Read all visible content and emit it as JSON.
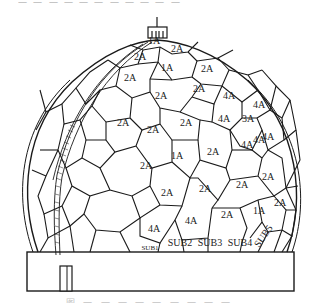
{
  "figure": {
    "caption_top_fragment": "一 一 一 一 一 一 一 一 一 一 一",
    "caption_bottom_fragment": "图 一 一 一 一 一 一 一 一 一",
    "colors": {
      "line": "#1a1a1a",
      "background": "#ffffff",
      "label": "#222222"
    }
  },
  "dome": {
    "panel_labels": [
      {
        "text": "1A",
        "x": 154,
        "y": 44
      },
      {
        "text": "2A",
        "x": 177,
        "y": 52
      },
      {
        "text": "2A",
        "x": 140,
        "y": 60
      },
      {
        "text": "1A",
        "x": 167,
        "y": 71
      },
      {
        "text": "2A",
        "x": 207,
        "y": 72
      },
      {
        "text": "2A",
        "x": 130,
        "y": 81
      },
      {
        "text": "2A",
        "x": 199,
        "y": 92
      },
      {
        "text": "2A",
        "x": 161,
        "y": 99
      },
      {
        "text": "4A",
        "x": 229,
        "y": 99
      },
      {
        "text": "4A",
        "x": 259,
        "y": 108
      },
      {
        "text": "2A",
        "x": 123,
        "y": 126
      },
      {
        "text": "2A",
        "x": 153,
        "y": 133
      },
      {
        "text": "4A",
        "x": 224,
        "y": 122
      },
      {
        "text": "3A",
        "x": 248,
        "y": 122
      },
      {
        "text": "4A",
        "x": 259,
        "y": 143
      },
      {
        "text": "2A",
        "x": 186,
        "y": 126
      },
      {
        "text": "2A",
        "x": 146,
        "y": 169
      },
      {
        "text": "1A",
        "x": 177,
        "y": 159
      },
      {
        "text": "2A",
        "x": 213,
        "y": 155
      },
      {
        "text": "4A",
        "x": 247,
        "y": 148
      },
      {
        "text": "4A",
        "x": 268,
        "y": 140
      },
      {
        "text": "2A",
        "x": 167,
        "y": 196
      },
      {
        "text": "2A",
        "x": 205,
        "y": 192
      },
      {
        "text": "2A",
        "x": 242,
        "y": 188
      },
      {
        "text": "2A",
        "x": 268,
        "y": 180
      },
      {
        "text": "2A",
        "x": 280,
        "y": 206
      },
      {
        "text": "1A",
        "x": 259,
        "y": 214
      },
      {
        "text": "2A",
        "x": 227,
        "y": 218
      },
      {
        "text": "4A",
        "x": 191,
        "y": 224
      },
      {
        "text": "4A",
        "x": 154,
        "y": 232
      }
    ],
    "sub_labels": [
      {
        "text": "SUB1",
        "x": 150,
        "y": 250,
        "size": 7
      },
      {
        "text": "SUB2",
        "x": 180,
        "y": 246,
        "size": 10
      },
      {
        "text": "SUB3",
        "x": 210,
        "y": 246,
        "size": 10
      },
      {
        "text": "SUB4",
        "x": 240,
        "y": 246,
        "size": 10
      },
      {
        "text": "SUB5",
        "x": 266,
        "y": 238,
        "size": 10,
        "rotate": -55
      }
    ]
  }
}
